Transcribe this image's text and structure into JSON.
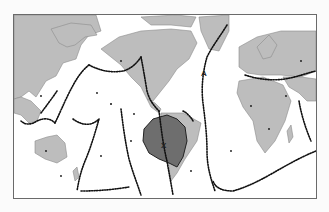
{
  "map": {
    "projection": "world-mercator-pacific-centered",
    "colors": {
      "background": "#ffffff",
      "land": "#bdbdbd",
      "land_outline": "#8c8c8c",
      "highlight_region": "#6e6e6e",
      "earthquake_dots": "#111111",
      "frame": "#6a6a6a"
    },
    "labels": [
      {
        "id": "label-a",
        "text": "A",
        "x": 203,
        "y": 73
      },
      {
        "id": "label-x",
        "text": "X",
        "x": 163,
        "y": 145
      }
    ],
    "legend": null
  }
}
